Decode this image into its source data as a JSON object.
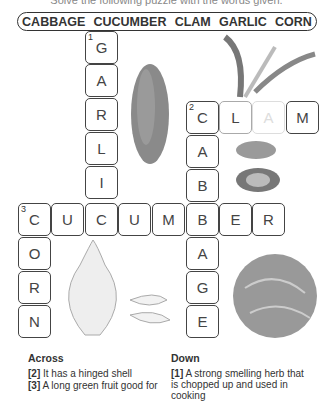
{
  "instruction": "Solve the following puzzle with the words given.",
  "word_bank": [
    "CABBAGE",
    "CUCUMBER",
    "CLAM",
    "GARLIC",
    "CORN"
  ],
  "grid": {
    "cells": [
      {
        "row": 0,
        "col": 2,
        "letter": "G",
        "number": "1"
      },
      {
        "row": 1,
        "col": 2,
        "letter": "A"
      },
      {
        "row": 2,
        "col": 2,
        "letter": "R"
      },
      {
        "row": 3,
        "col": 2,
        "letter": "L"
      },
      {
        "row": 4,
        "col": 2,
        "letter": "I"
      },
      {
        "row": 2,
        "col": 5,
        "letter": "C",
        "number": "2"
      },
      {
        "row": 2,
        "col": 6,
        "letter": "L"
      },
      {
        "row": 2,
        "col": 7,
        "letter": "A"
      },
      {
        "row": 2,
        "col": 8,
        "letter": "M"
      },
      {
        "row": 3,
        "col": 5,
        "letter": "A"
      },
      {
        "row": 4,
        "col": 5,
        "letter": "B"
      },
      {
        "row": 5,
        "col": 0,
        "letter": "C",
        "number": "3"
      },
      {
        "row": 5,
        "col": 1,
        "letter": "U"
      },
      {
        "row": 5,
        "col": 2,
        "letter": "C"
      },
      {
        "row": 5,
        "col": 3,
        "letter": "U"
      },
      {
        "row": 5,
        "col": 4,
        "letter": "M"
      },
      {
        "row": 5,
        "col": 5,
        "letter": "B"
      },
      {
        "row": 5,
        "col": 6,
        "letter": "E"
      },
      {
        "row": 5,
        "col": 7,
        "letter": "R"
      },
      {
        "row": 6,
        "col": 0,
        "letter": "O"
      },
      {
        "row": 7,
        "col": 0,
        "letter": "R"
      },
      {
        "row": 8,
        "col": 0,
        "letter": "N"
      },
      {
        "row": 6,
        "col": 5,
        "letter": "A"
      },
      {
        "row": 7,
        "col": 5,
        "letter": "G"
      },
      {
        "row": 8,
        "col": 5,
        "letter": "E"
      }
    ]
  },
  "clues": {
    "across_title": "Across",
    "down_title": "Down",
    "across": [
      {
        "num": "[2]",
        "text": "It has a hinged shell"
      },
      {
        "num": "[3]",
        "text": "A long green fruit good for"
      }
    ],
    "down": [
      {
        "num": "[1]",
        "text": "A strong smelling herb that is chopped up and used in cooking"
      }
    ]
  },
  "images": [
    "cucumber-image",
    "clam-image",
    "garlic-image",
    "cabbage-image",
    "corn-image"
  ]
}
